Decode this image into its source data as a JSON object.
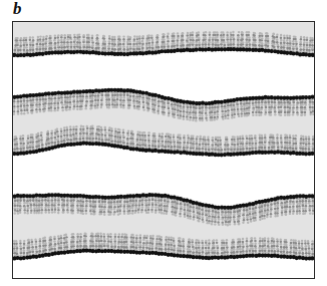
{
  "figure": {
    "panel_label": "b",
    "caption_text": "",
    "frame": {
      "border_color": "#2b2b2b",
      "background_color": "#ffffff",
      "x": 12,
      "y": 21,
      "width": 303,
      "height": 258
    }
  },
  "colors": {
    "headgroup": "#111111",
    "tail": "#8a8a8a",
    "tail_light": "#b5b5b5",
    "solvent": "#e3e3e3",
    "water_gap": "#ffffff",
    "frame": "#2b2b2b",
    "label": "#141414"
  },
  "simulation": {
    "type": "lipid-bilayer-stack",
    "leaflet_count": 5,
    "bilayer_count": 2,
    "lipids_per_leaflet": 96,
    "headgroup_radius": 2.1,
    "tail_length": 17,
    "tail_beads": 7,
    "leaflets": [
      {
        "name": "leaflet-1-top",
        "headgroup_side": "bottom",
        "baseline": 30,
        "amplitudes": [
          2.0,
          1.4,
          -0.8
        ],
        "phases": [
          0.55,
          2.1,
          4.3
        ],
        "wavenumbers": [
          1,
          2,
          3
        ],
        "solvent_above": true,
        "solvent_below": false
      },
      {
        "name": "leaflet-2-upper",
        "headgroup_side": "top",
        "baseline": 74,
        "amplitudes": [
          5.0,
          2.4,
          1.0
        ],
        "phases": [
          3.25,
          0.4,
          2.8
        ],
        "wavenumbers": [
          1,
          2,
          3
        ],
        "solvent_above": false,
        "solvent_below": true
      },
      {
        "name": "leaflet-3-lower",
        "headgroup_side": "bottom",
        "baseline": 128,
        "amplitudes": [
          4.4,
          2.0,
          -1.2
        ],
        "phases": [
          3.05,
          1.3,
          3.9
        ],
        "wavenumbers": [
          1,
          2,
          3
        ],
        "solvent_above": true,
        "solvent_below": false
      },
      {
        "name": "leaflet-4-upper",
        "headgroup_side": "top",
        "baseline": 176,
        "amplitudes": [
          4.6,
          3.0,
          1.4
        ],
        "phases": [
          3.4,
          5.1,
          1.2
        ],
        "wavenumbers": [
          1,
          2,
          3
        ],
        "solvent_above": false,
        "solvent_below": true
      },
      {
        "name": "leaflet-5-bottom",
        "headgroup_side": "bottom",
        "baseline": 232,
        "amplitudes": [
          3.0,
          1.6,
          -0.9
        ],
        "phases": [
          2.7,
          0.9,
          4.6
        ],
        "wavenumbers": [
          1,
          2,
          3
        ],
        "solvent_above": true,
        "solvent_below": false
      }
    ],
    "solvent_regions": [
      {
        "name": "solvent-top",
        "from_leaflet": "frame-top",
        "to_leaflet": "leaflet-1-top"
      },
      {
        "name": "solvent-middle",
        "from_leaflet": "leaflet-2-upper",
        "to_leaflet": "leaflet-3-lower"
      },
      {
        "name": "solvent-lower",
        "from_leaflet": "leaflet-4-upper",
        "to_leaflet": "leaflet-5-bottom"
      }
    ],
    "water_gaps": [
      {
        "name": "water-gap-1",
        "from_leaflet": "leaflet-1-top",
        "to_leaflet": "leaflet-2-upper"
      },
      {
        "name": "water-gap-2",
        "from_leaflet": "leaflet-3-lower",
        "to_leaflet": "leaflet-4-upper"
      },
      {
        "name": "water-gap-3",
        "from_leaflet": "leaflet-5-bottom",
        "to_leaflet": "frame-bottom"
      }
    ]
  }
}
